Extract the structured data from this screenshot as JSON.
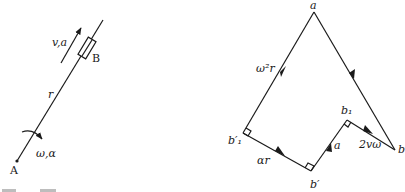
{
  "left_figure": {
    "labels": {
      "va": "v,a",
      "B": "B",
      "r": "r",
      "omega_alpha": "ω,α",
      "A": "A"
    }
  },
  "right_figure": {
    "labels": {
      "a": "a",
      "omega2r": "ω²r",
      "b1prime": "b′₁",
      "alpha_r": "αr",
      "bprime": "b′",
      "a_acc": "a",
      "b1": "b₁",
      "coriolis": "2vω",
      "b": "b"
    }
  }
}
